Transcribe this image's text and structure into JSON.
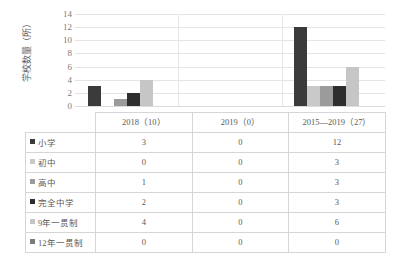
{
  "chart_data": {
    "type": "bar",
    "title": "",
    "subtitle": "",
    "xlabel": "",
    "ylabel": "学校数量（所）",
    "categories": [
      "2018（10）",
      "2019（0）",
      "2015—2019（27）"
    ],
    "series": [
      {
        "name": "小学",
        "color": "#3b3b3b",
        "values": [
          3,
          0,
          12
        ]
      },
      {
        "name": "初中",
        "color": "#c9c9c9",
        "values": [
          0,
          0,
          3
        ]
      },
      {
        "name": "高中",
        "color": "#9b9b9b",
        "values": [
          1,
          0,
          3
        ]
      },
      {
        "name": "完全中学",
        "color": "#2e2e2e",
        "values": [
          2,
          0,
          3
        ]
      },
      {
        "name": "9年一贯制",
        "color": "#c6c6c6",
        "values": [
          4,
          0,
          6
        ]
      },
      {
        "name": "12年一贯制",
        "color": "#7a7a7a",
        "values": [
          0,
          0,
          0
        ]
      }
    ],
    "yticks": [
      0,
      2,
      4,
      6,
      8,
      10,
      12,
      14
    ],
    "ylim": [
      0,
      14
    ],
    "grid": true,
    "legend_position": "table-left-column",
    "gridline_color": "#e4e4e4"
  },
  "table": {
    "corner_label": "",
    "column_headers": [
      "2018（10）",
      "2019（0）",
      "2015—2019（27）"
    ],
    "rows": [
      {
        "label": "小学",
        "swatch": "#3b3b3b",
        "values": [
          "3",
          "0",
          "12"
        ]
      },
      {
        "label": "初中",
        "swatch": "#c9c9c9",
        "values": [
          "0",
          "0",
          "3"
        ]
      },
      {
        "label": "高中",
        "swatch": "#9b9b9b",
        "values": [
          "1",
          "0",
          "3"
        ]
      },
      {
        "label": "完全中学",
        "swatch": "#2e2e2e",
        "values": [
          "2",
          "0",
          "3"
        ]
      },
      {
        "label": "9年一贯制",
        "swatch": "#c6c6c6",
        "values": [
          "4",
          "0",
          "0"
        ]
      },
      {
        "label": "12年一贯制",
        "swatch": "#7a7a7a",
        "values": [
          "0",
          "0",
          "0"
        ]
      }
    ]
  },
  "table_display": {
    "r0c0": "3",
    "r0c1": "0",
    "r0c2": "12",
    "r1c0": "0",
    "r1c1": "0",
    "r1c2": "3",
    "r2c0": "1",
    "r2c1": "0",
    "r2c2": "3",
    "r3c0": "2",
    "r3c1": "0",
    "r3c2": "3",
    "r4c0": "4",
    "r4c1": "0",
    "r4c2": "6",
    "r5c0": "0",
    "r5c1": "0",
    "r5c2": "0"
  },
  "axis": {
    "y_title": "学校数量（所）",
    "y_tick_labels": [
      "14",
      "12",
      "10",
      "8",
      "6",
      "4",
      "2",
      "0"
    ]
  }
}
